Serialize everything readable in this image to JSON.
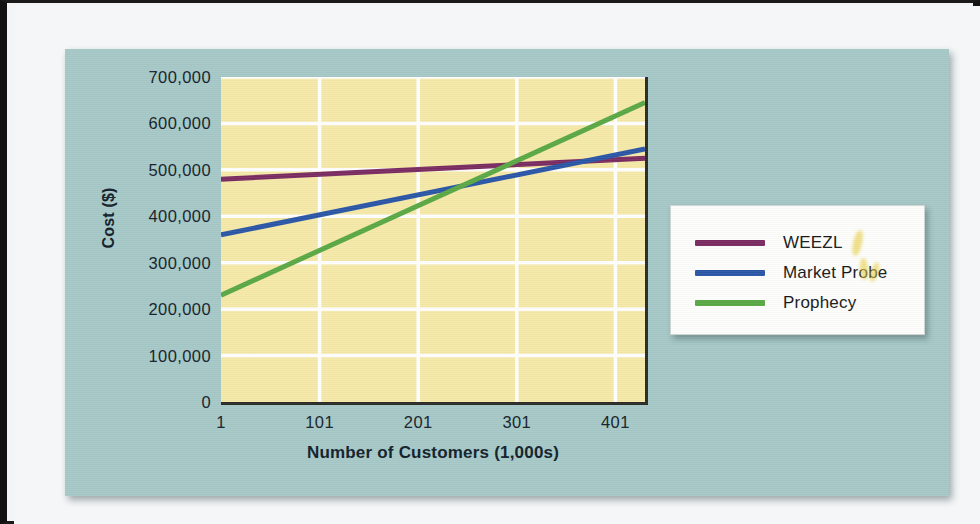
{
  "chart_data": {
    "type": "line",
    "title": "",
    "xlabel": "Number of Customers (1,000s)",
    "ylabel": "Cost ($)",
    "xlim": [
      1,
      431
    ],
    "ylim": [
      0,
      700000
    ],
    "x_ticks": [
      "1",
      "101",
      "201",
      "301",
      "401"
    ],
    "x_tick_values": [
      1,
      101,
      201,
      301,
      401
    ],
    "y_ticks": [
      "0",
      "100,000",
      "200,000",
      "300,000",
      "400,000",
      "500,000",
      "600,000",
      "700,000"
    ],
    "y_tick_values": [
      0,
      100000,
      200000,
      300000,
      400000,
      500000,
      600000,
      700000
    ],
    "grid": true,
    "legend_position": "right",
    "plot_background": "#f5e9a8",
    "panel_background": "#a5c8c6",
    "series": [
      {
        "name": "WEEZL",
        "color": "#7a2b61",
        "x": [
          1,
          431
        ],
        "values": [
          480000,
          525000
        ]
      },
      {
        "name": "Market Probe",
        "color": "#2a55a6",
        "x": [
          1,
          431
        ],
        "values": [
          360000,
          545000
        ]
      },
      {
        "name": "Prophecy",
        "color": "#5aa845",
        "x": [
          1,
          431
        ],
        "values": [
          230000,
          645000
        ]
      }
    ]
  },
  "legend": {
    "items": [
      {
        "label": "WEEZL",
        "color": "#7a2b61"
      },
      {
        "label": "Market Probe",
        "color": "#2a55a6"
      },
      {
        "label": "Prophecy",
        "color": "#5aa845"
      }
    ]
  },
  "axes": {
    "x_title": "Number of Customers (1,000s)",
    "y_title": "Cost ($)"
  }
}
